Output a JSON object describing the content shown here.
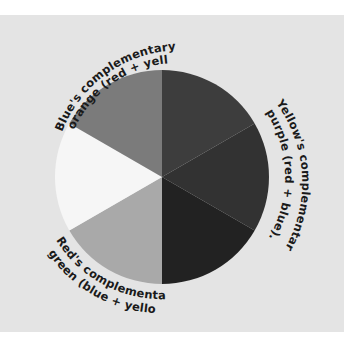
{
  "diagram": {
    "center": {
      "x": 162,
      "y": 177
    },
    "radius": 107,
    "background_color": "#e4e4e4",
    "slices": [
      {
        "name": "violet-red",
        "start_deg": 0,
        "end_deg": 60,
        "color": "#3d3d3d"
      },
      {
        "name": "purple",
        "start_deg": 60,
        "end_deg": 120,
        "color": "#323232"
      },
      {
        "name": "blue",
        "start_deg": 120,
        "end_deg": 180,
        "color": "#222222"
      },
      {
        "name": "green",
        "start_deg": 180,
        "end_deg": 240,
        "color": "#a9a9a9"
      },
      {
        "name": "yellow",
        "start_deg": 240,
        "end_deg": 300,
        "color": "#f6f6f6"
      },
      {
        "name": "orange",
        "start_deg": 300,
        "end_deg": 360,
        "color": "#7b7b7b"
      }
    ],
    "labels": {
      "blue": {
        "line1": "Blue's complementary is",
        "line2": "orange (red + yellow)."
      },
      "yellow": {
        "line1": "Yellow's complementary is",
        "line2": "purple (red + blue)."
      },
      "red": {
        "line1": "Red's complementary is",
        "line2": "green (blue + yellow)."
      }
    }
  }
}
